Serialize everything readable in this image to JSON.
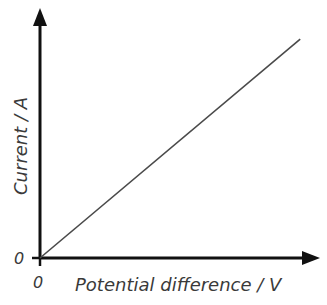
{
  "chart_data": {
    "type": "line",
    "title": "",
    "xlabel": "Potential difference / V",
    "ylabel": "Current / A",
    "x_tick_labels": [
      "0"
    ],
    "y_tick_labels": [
      "0"
    ],
    "xlim": [
      0,
      1
    ],
    "ylim": [
      0,
      1
    ],
    "grid": false,
    "legend": "none",
    "series": [
      {
        "name": "Current vs potential difference",
        "x": [
          0,
          0.96
        ],
        "y": [
          0,
          0.96
        ],
        "color": "#4a4a4a"
      }
    ],
    "axis_color": "#111111"
  }
}
